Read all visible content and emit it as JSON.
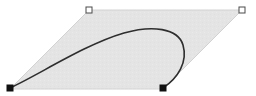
{
  "canvas": {
    "name": "shape-editor-canvas",
    "width": 256,
    "height": 96,
    "background_color": "#ffffff"
  },
  "selection_shape": {
    "name": "parallelogram-selection-bounds",
    "kind": "parallelogram",
    "fill_color": "#e4e4e4",
    "stroke_color": "#d2d2d2",
    "stroke_width": 1,
    "points": "89,10 242,10 163,89 10,89",
    "corners": [
      {
        "id": "top-left",
        "x": 89,
        "y": 10
      },
      {
        "id": "top-right",
        "x": 242,
        "y": 10
      },
      {
        "id": "bottom-right",
        "x": 163,
        "y": 89
      },
      {
        "id": "bottom-left",
        "x": 10,
        "y": 89
      }
    ]
  },
  "curve": {
    "name": "bezier-hook-path",
    "stroke_color": "#2e2e2e",
    "stroke_width": 1.6,
    "fill": "none",
    "path": "M 10 88 C 40 74 86 44 124 33 C 152 25 178 28 183 45 C 188 62 178 78 163 88",
    "start_point": {
      "x": 10,
      "y": 88
    },
    "end_point": {
      "x": 163,
      "y": 88
    },
    "apex_point": {
      "x": 146,
      "y": 30
    },
    "rightmost_point": {
      "x": 184,
      "y": 50
    }
  },
  "handles": [
    {
      "id": "handle-top-left",
      "name": "selection-handle-top-left",
      "style": "hollow",
      "x": 89,
      "y": 10,
      "size": 6,
      "fill_color": "#ffffff",
      "stroke_color": "#4a4a4a"
    },
    {
      "id": "handle-top-right",
      "name": "selection-handle-top-right",
      "style": "hollow",
      "x": 242,
      "y": 10,
      "size": 6,
      "fill_color": "#ffffff",
      "stroke_color": "#4a4a4a"
    },
    {
      "id": "handle-bottom-left",
      "name": "selection-handle-bottom-left",
      "style": "filled",
      "x": 10,
      "y": 88,
      "size": 6,
      "fill_color": "#111111",
      "stroke_color": "#111111"
    },
    {
      "id": "handle-bottom-right",
      "name": "selection-handle-bottom-right",
      "style": "filled",
      "x": 163,
      "y": 88,
      "size": 6,
      "fill_color": "#111111",
      "stroke_color": "#111111"
    }
  ]
}
